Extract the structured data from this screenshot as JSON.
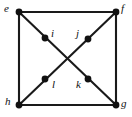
{
  "figure": {
    "kind": "graph-diagram",
    "width": 132,
    "height": 117,
    "background_color": "#ffffff",
    "edge_color": "#1a1a1a",
    "vertex_color": "#111111",
    "label_color": "#111111",
    "edge_width": 2.1,
    "vertex_radius": 3.4
  },
  "vertices": [
    {
      "id": "e",
      "label": "e",
      "x": 19,
      "y": 12,
      "label_x": 4,
      "label_y": 3,
      "role": "corner-top-left"
    },
    {
      "id": "f",
      "label": "f",
      "x": 116,
      "y": 12,
      "label_x": 121,
      "label_y": 3,
      "role": "corner-top-right"
    },
    {
      "id": "g",
      "label": "g",
      "x": 116,
      "y": 105,
      "label_x": 121,
      "label_y": 98,
      "role": "corner-bottom-right"
    },
    {
      "id": "h",
      "label": "h",
      "x": 19,
      "y": 105,
      "label_x": 5,
      "label_y": 96,
      "role": "corner-bottom-left"
    },
    {
      "id": "i",
      "label": "i",
      "x": 45,
      "y": 38,
      "label_x": 51,
      "label_y": 28,
      "role": "inner-upper-left"
    },
    {
      "id": "j",
      "label": "j",
      "x": 88,
      "y": 39,
      "label_x": 76,
      "label_y": 28,
      "role": "inner-upper-right"
    },
    {
      "id": "k",
      "label": "k",
      "x": 88,
      "y": 79,
      "label_x": 76,
      "label_y": 79,
      "role": "inner-lower-right"
    },
    {
      "id": "l",
      "label": "l",
      "x": 45,
      "y": 79,
      "label_x": 52,
      "label_y": 79,
      "role": "inner-lower-left"
    }
  ],
  "edges": [
    {
      "id": "e-f",
      "from": "e",
      "to": "f",
      "kind": "square-top"
    },
    {
      "id": "f-g",
      "from": "f",
      "to": "g",
      "kind": "square-right"
    },
    {
      "id": "h-g",
      "from": "h",
      "to": "g",
      "kind": "square-bottom"
    },
    {
      "id": "e-h",
      "from": "e",
      "to": "h",
      "kind": "square-left"
    },
    {
      "id": "e-g",
      "from": "e",
      "to": "g",
      "kind": "diagonal",
      "passes_through": [
        "i",
        "k"
      ]
    },
    {
      "id": "f-h",
      "from": "f",
      "to": "h",
      "kind": "diagonal",
      "passes_through": [
        "j",
        "l"
      ]
    }
  ],
  "crossing_point": {
    "x": 67,
    "y": 59
  }
}
